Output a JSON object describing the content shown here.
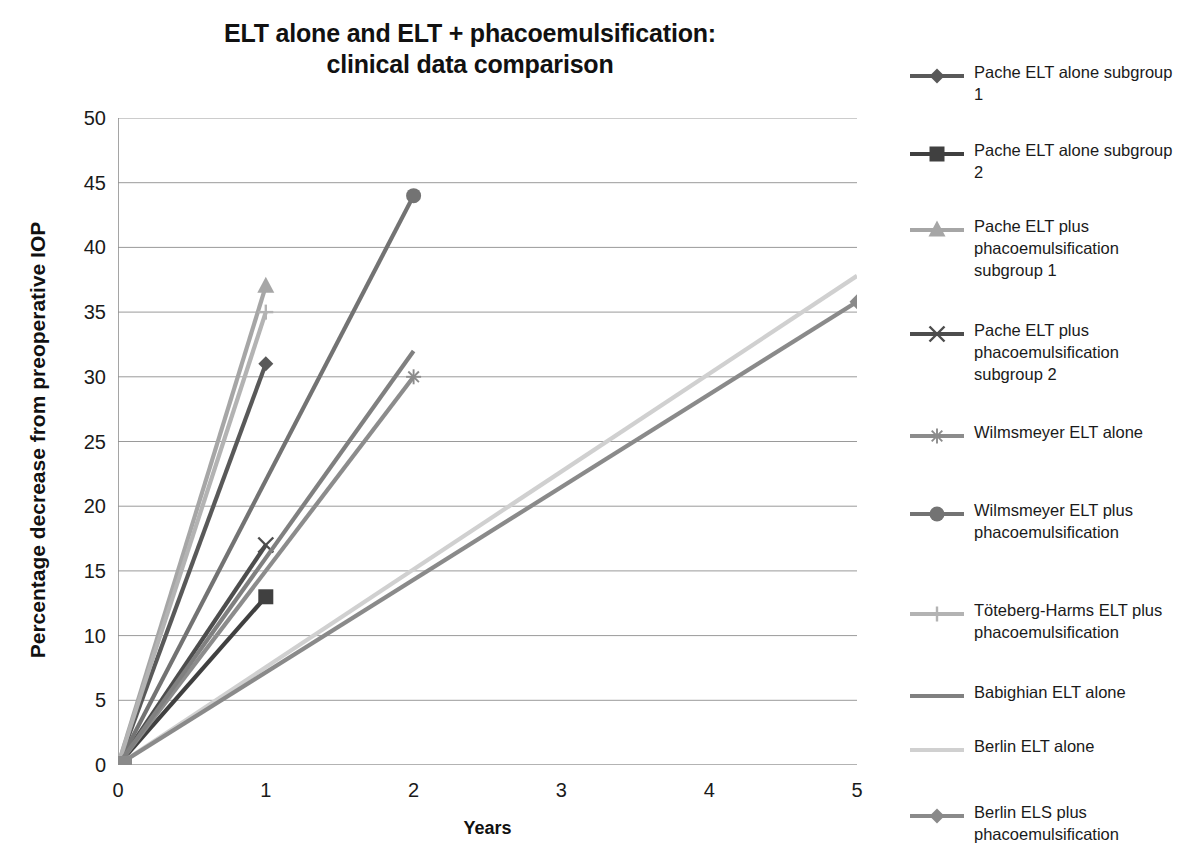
{
  "title": {
    "line1": "ELT alone and ELT + phacoemulsification:",
    "line2": "clinical data comparison"
  },
  "axes": {
    "xlabel": "Years",
    "ylabel": "Percentage decrease from preoperative IOP",
    "xticks": [
      "0",
      "1",
      "2",
      "3",
      "4",
      "5"
    ],
    "yticks": [
      "0",
      "5",
      "10",
      "15",
      "20",
      "25",
      "30",
      "35",
      "40",
      "45",
      "50"
    ]
  },
  "legend": {
    "items": [
      {
        "label": "Pache ELT alone subgroup 1",
        "marker": "diamond-marker",
        "color": "#595959"
      },
      {
        "label": "Pache ELT alone subgroup 2",
        "marker": "square-marker",
        "color": "#404040"
      },
      {
        "label": "Pache ELT plus phacoemulsification subgroup 1",
        "marker": "triangle-marker",
        "color": "#a6a6a6"
      },
      {
        "label": "Pache ELT plus phacoemulsification subgroup 2",
        "marker": "x-marker",
        "color": "#4d4d4d"
      },
      {
        "label": "Wilmsmeyer ELT alone",
        "marker": "asterisk-marker",
        "color": "#8c8c8c"
      },
      {
        "label": "Wilmsmeyer ELT plus phacoemulsification",
        "marker": "circle-marker",
        "color": "#737373"
      },
      {
        "label": "Töteberg-Harms ELT plus phacoemulsification",
        "marker": "plus-marker",
        "color": "#b3b3b3"
      },
      {
        "label": "Babighian ELT alone",
        "marker": "line-only",
        "color": "#808080"
      },
      {
        "label": "Berlin ELT alone",
        "marker": "line-only",
        "color": "#d0d0d0"
      },
      {
        "label": "Berlin ELS plus phacoemulsification",
        "marker": "diamond-marker",
        "color": "#8a8a8a"
      }
    ]
  },
  "chart_data": {
    "type": "line",
    "title": "ELT alone and ELT + phacoemulsification: clinical data comparison",
    "xlabel": "Years",
    "ylabel": "Percentage decrease from preoperative IOP",
    "xlim": [
      0,
      5
    ],
    "ylim": [
      0,
      50
    ],
    "x_tick_values": [
      0,
      1,
      2,
      3,
      4,
      5
    ],
    "y_tick_values": [
      0,
      5,
      10,
      15,
      20,
      25,
      30,
      35,
      40,
      45,
      50
    ],
    "grid": "horizontal",
    "legend_position": "right",
    "series": [
      {
        "name": "Pache ELT alone subgroup 1",
        "marker": "diamond",
        "color": "#595959",
        "x": [
          0,
          1
        ],
        "y": [
          0,
          31
        ]
      },
      {
        "name": "Pache ELT alone subgroup 2",
        "marker": "square",
        "color": "#404040",
        "x": [
          0,
          1
        ],
        "y": [
          0,
          13
        ]
      },
      {
        "name": "Pache ELT plus phacoemulsification subgroup 1",
        "marker": "triangle",
        "color": "#a6a6a6",
        "x": [
          0,
          1
        ],
        "y": [
          0,
          37
        ]
      },
      {
        "name": "Pache ELT plus phacoemulsification subgroup 2",
        "marker": "x",
        "color": "#4d4d4d",
        "x": [
          0,
          1
        ],
        "y": [
          0,
          17
        ]
      },
      {
        "name": "Wilmsmeyer ELT alone",
        "marker": "asterisk",
        "color": "#8c8c8c",
        "x": [
          0,
          2
        ],
        "y": [
          0,
          30
        ]
      },
      {
        "name": "Wilmsmeyer ELT plus phacoemulsification",
        "marker": "circle",
        "color": "#737373",
        "x": [
          0,
          2
        ],
        "y": [
          0,
          44
        ]
      },
      {
        "name": "Töteberg-Harms ELT plus phacoemulsification",
        "marker": "plus",
        "color": "#b3b3b3",
        "x": [
          0,
          1
        ],
        "y": [
          0,
          35
        ]
      },
      {
        "name": "Babighian ELT alone",
        "marker": "none",
        "color": "#808080",
        "x": [
          0,
          2
        ],
        "y": [
          0,
          32
        ]
      },
      {
        "name": "Berlin ELT alone",
        "marker": "none",
        "color": "#d0d0d0",
        "x": [
          0,
          5
        ],
        "y": [
          0,
          37.8
        ]
      },
      {
        "name": "Berlin ELS plus phacoemulsification",
        "marker": "diamond",
        "color": "#8a8a8a",
        "x": [
          0,
          5
        ],
        "y": [
          0,
          35.8
        ]
      }
    ]
  }
}
